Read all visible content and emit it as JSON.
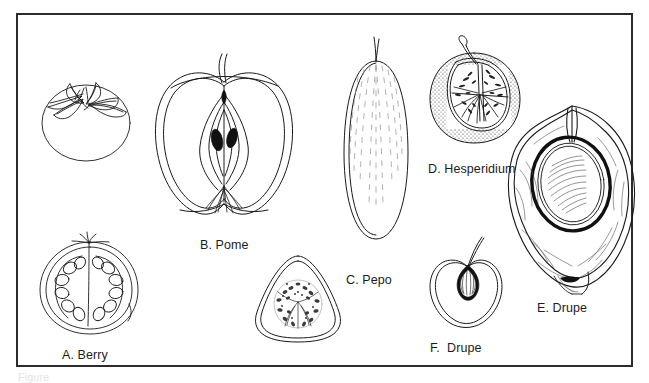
{
  "figure": {
    "kind": "botanical-line-drawing-plate",
    "frame": {
      "border_color": "#2b2b2b",
      "background": "#ffffff"
    },
    "ink_color": "#1a1a1a",
    "bottom_caption": "Figure"
  },
  "labels": [
    {
      "id": "a",
      "text": "A. Berry",
      "subject": "tomato-cross-section"
    },
    {
      "id": "b",
      "text": "B. Pome",
      "subject": "apple-cross-section"
    },
    {
      "id": "c",
      "text": "C. Pepo",
      "subject": "cucumber"
    },
    {
      "id": "d",
      "text": "D. Hesperidium",
      "subject": "orange-cut"
    },
    {
      "id": "e",
      "text": "E. Drupe",
      "subject": "avocado-cross-section"
    },
    {
      "id": "f",
      "text": "F.  Drupe",
      "subject": "cherry-cross-section"
    }
  ],
  "drawings": [
    {
      "id": "tomato-whole",
      "name": "whole-tomato-with-calyx"
    },
    {
      "id": "tomato-cut",
      "name": "tomato-cross-section-with-seeds"
    },
    {
      "id": "apple-cut",
      "name": "apple-longitudinal-section-with-seeds"
    },
    {
      "id": "cucumber-whole",
      "name": "cucumber-whole"
    },
    {
      "id": "cucumber-cross",
      "name": "cucumber-cross-section-with-seeds"
    },
    {
      "id": "orange-cut",
      "name": "orange-with-stippled-rind-and-segments"
    },
    {
      "id": "avocado-cut",
      "name": "avocado-half-with-large-pit"
    },
    {
      "id": "cherry-cut",
      "name": "cherry-with-stem-and-pit"
    }
  ]
}
